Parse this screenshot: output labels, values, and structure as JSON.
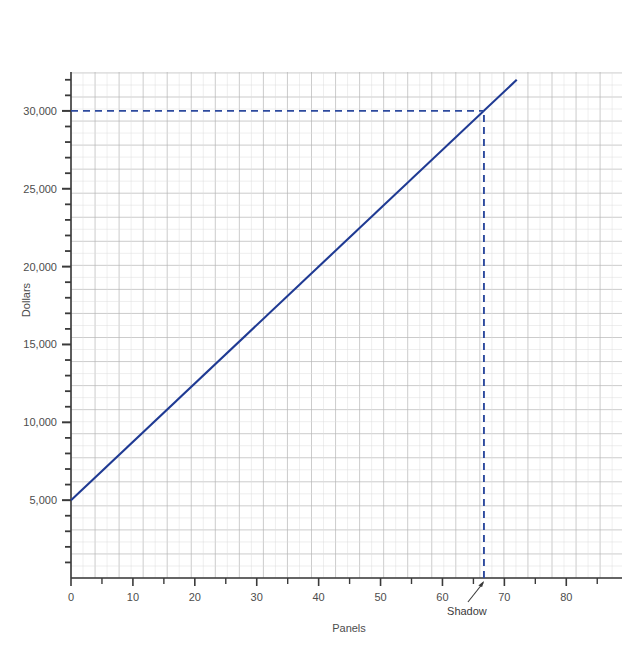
{
  "chart_data": {
    "type": "line",
    "title": "",
    "subtitle": "",
    "xlabel": "Panels",
    "ylabel": "Dollars",
    "xlim": [
      0,
      89
    ],
    "ylim": [
      0,
      32500
    ],
    "grid": true,
    "legend_position": "none",
    "x_ticks_major": [
      0,
      10,
      20,
      30,
      40,
      50,
      60,
      70,
      80
    ],
    "x_tick_labels": [
      "0",
      "10",
      "20",
      "30",
      "40",
      "50",
      "60",
      "70",
      "80"
    ],
    "x_ticks_minor_step": 5,
    "y_ticks_major": [
      5000,
      10000,
      15000,
      20000,
      25000,
      30000
    ],
    "y_tick_labels": [
      "5,000",
      "10,000",
      "15,000",
      "20,000",
      "25,000",
      "30,000"
    ],
    "y_ticks_minor_step": 1000,
    "series": [
      {
        "name": "Cost",
        "kind": "solid-line",
        "color": "#1f3a93",
        "x": [
          0,
          72
        ],
        "values": [
          5000,
          32000
        ],
        "intercept": 5000,
        "slope": 375
      },
      {
        "name": "Shadow horizontal guide",
        "kind": "dashed-line",
        "color": "#2d4a9e",
        "x": [
          0,
          66.7
        ],
        "values": [
          30000,
          30000
        ]
      },
      {
        "name": "Shadow vertical guide",
        "kind": "dashed-line",
        "color": "#2d4a9e",
        "x": [
          66.7,
          66.7
        ],
        "values": [
          0,
          30000
        ]
      }
    ],
    "annotations": [
      {
        "label": "Shadow",
        "target_x": 66.7,
        "target_y": 0,
        "note": "arrow points to the vertical dashed guideline where it meets the x axis"
      }
    ]
  },
  "axes": {
    "y_label": "Dollars",
    "x_label": "Panels",
    "y_tick_labels": [
      "30,000",
      "25,000",
      "20,000",
      "15,000",
      "10,000",
      "5,000"
    ],
    "x_tick_labels": [
      "0",
      "10",
      "20",
      "30",
      "40",
      "50",
      "60",
      "70",
      "80"
    ]
  },
  "annotation": {
    "shadow_label": "Shadow"
  },
  "colors": {
    "line": "#1f3a93",
    "dashed": "#2d4a9e",
    "grid_major": "#b6b6b6",
    "grid_minor": "#dcdcdc",
    "axis": "#3a3a3a",
    "text": "#4d4d4d",
    "background": "#ffffff"
  }
}
